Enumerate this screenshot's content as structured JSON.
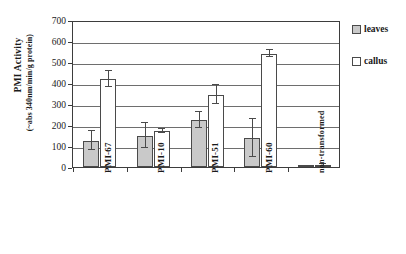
{
  "chart_data": {
    "type": "bar",
    "title": "",
    "xlabel": "",
    "ylabel": "PMI Activity",
    "ylabel_sub": "(~abs 340nm/min/g protein)",
    "ylim": [
      0,
      700
    ],
    "yticks": [
      0,
      100,
      200,
      300,
      400,
      500,
      600,
      700
    ],
    "grid": true,
    "legend_position": "right",
    "categories": [
      "PMI-67",
      "PMI-10",
      "PMI-51",
      "PMI-60",
      "non-transformed"
    ],
    "series": [
      {
        "name": "leaves",
        "color": "#c9c9c9",
        "values": [
          125,
          150,
          225,
          140,
          5
        ],
        "errors": [
          45,
          58,
          38,
          90,
          2
        ]
      },
      {
        "name": "callus",
        "color": "#ffffff",
        "values": [
          420,
          170,
          345,
          540,
          10
        ],
        "errors": [
          38,
          10,
          45,
          18,
          6
        ]
      }
    ]
  },
  "axis": {
    "y_title": "PMI Activity",
    "y_title_sub": "(~abs 340nm/min/g protein)",
    "tick_labels": [
      "700",
      "600",
      "500",
      "400",
      "300",
      "200",
      "100",
      "0"
    ]
  },
  "legend": {
    "items": [
      {
        "label": "leaves",
        "swatch": "leaves-swatch"
      },
      {
        "label": "callus",
        "swatch": "callus-swatch"
      }
    ]
  }
}
